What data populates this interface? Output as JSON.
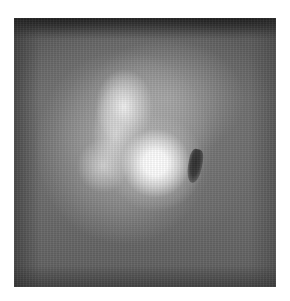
{
  "image": {
    "kind": "grayscale-scan",
    "description": "Grayscale nuclear-medicine style scan with a bright upper elongated uptake region, a brighter round lower uptake focus, and a small dark photopenic mark to the right",
    "palette": {
      "background": "#6a6a6a",
      "dark_top_band": "#3a3a3a",
      "hotspot": "#ffffff",
      "upper_uptake": "#e6e6e6",
      "dark_mark": "#2e2e2e",
      "page": "#ffffff"
    },
    "regions": [
      {
        "name": "upper-uptake",
        "shape": "elongated-vertical",
        "intensity": "high"
      },
      {
        "name": "lower-hotspot",
        "shape": "round",
        "intensity": "very-high"
      },
      {
        "name": "dark-mark",
        "shape": "small-curved",
        "intensity": "low"
      }
    ]
  }
}
